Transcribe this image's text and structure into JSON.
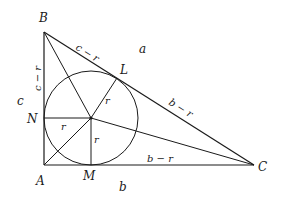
{
  "diagram": {
    "type": "right-triangle-incircle",
    "vertices": {
      "A": {
        "label": "A",
        "x": 44,
        "y": 165
      },
      "B": {
        "label": "B",
        "x": 44,
        "y": 32
      },
      "C": {
        "label": "C",
        "x": 254,
        "y": 165
      }
    },
    "tangent_points": {
      "N": {
        "label": "N",
        "x": 44,
        "y": 118
      },
      "M": {
        "label": "M",
        "x": 91,
        "y": 165
      },
      "L": {
        "label": "L",
        "x": 117,
        "y": 78
      }
    },
    "incenter": {
      "x": 91,
      "y": 118,
      "radius": 47
    },
    "side_labels": {
      "a": "a",
      "b": "b",
      "c": "c"
    },
    "segment_labels": {
      "BL": "c − r",
      "BN": "c − r",
      "LC": "b − r",
      "MC": "b − r"
    },
    "radius_labels": {
      "IL": "r",
      "IN": "r",
      "IM": "r"
    }
  }
}
